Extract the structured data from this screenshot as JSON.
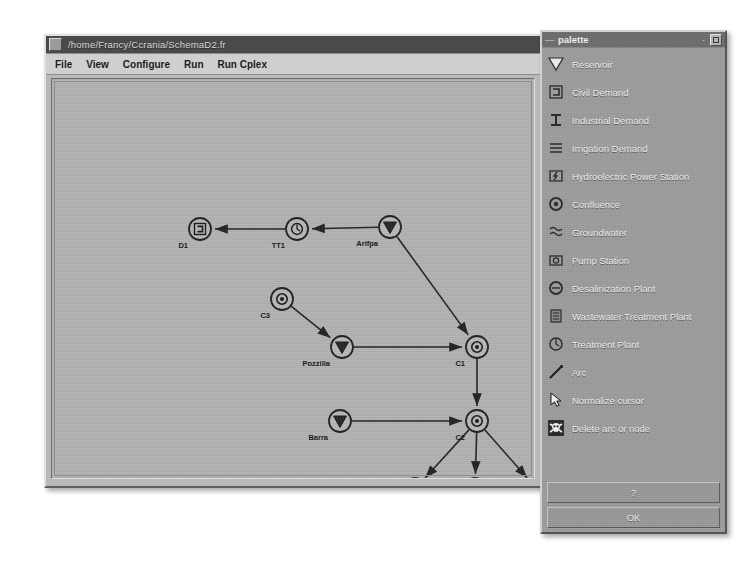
{
  "window": {
    "title": "/home/Francy/Ccrania/SchemaD2.fr",
    "menu": [
      "File",
      "View",
      "Configure",
      "Run",
      "Run Cplex"
    ]
  },
  "palette": {
    "title": "palette",
    "menu_glyph": "—",
    "minimize_glyph": "·",
    "items": [
      {
        "label": "Reservoir",
        "icon": "reservoir-triangle-icon"
      },
      {
        "label": "Civil Demand",
        "icon": "civil-demand-icon"
      },
      {
        "label": "Industrial Demand",
        "icon": "industrial-demand-icon"
      },
      {
        "label": "Irrigation Demand",
        "icon": "irrigation-demand-icon"
      },
      {
        "label": "Hydroelectric Power Station",
        "icon": "hydroelectric-power-station-icon"
      },
      {
        "label": "Confluence",
        "icon": "confluence-icon"
      },
      {
        "label": "Groundwater",
        "icon": "groundwater-icon"
      },
      {
        "label": "Pump Station",
        "icon": "pump-station-icon"
      },
      {
        "label": "Desalinization Plant",
        "icon": "desalinization-plant-icon"
      },
      {
        "label": "Wastewater Treatment Plant",
        "icon": "wastewater-treatment-plant-icon"
      },
      {
        "label": "Treatment Plant",
        "icon": "treatment-plant-icon"
      },
      {
        "label": "Arc",
        "icon": "arc-line-icon"
      },
      {
        "label": "Normalize cursor",
        "icon": "cursor-arrow-icon"
      },
      {
        "label": "Delete arc or node",
        "icon": "skull-delete-icon"
      }
    ],
    "buttons": [
      {
        "label": "?",
        "name": "help-button"
      },
      {
        "label": "OK",
        "name": "ok-button"
      }
    ]
  },
  "diagram": {
    "nodes": [
      {
        "id": "D1",
        "label": "D1",
        "type": "civil-demand",
        "x": 148,
        "y": 150
      },
      {
        "id": "TT1",
        "label": "TT1",
        "type": "treatment-plant",
        "x": 245,
        "y": 150
      },
      {
        "id": "Arifpa",
        "label": "Arifpa",
        "type": "reservoir",
        "x": 338,
        "y": 148
      },
      {
        "id": "C3",
        "label": "C3",
        "type": "confluence",
        "x": 230,
        "y": 220
      },
      {
        "id": "Pozzilla",
        "label": "Pozzilla",
        "type": "reservoir",
        "x": 290,
        "y": 268
      },
      {
        "id": "C1",
        "label": "C1",
        "type": "confluence",
        "x": 425,
        "y": 268
      },
      {
        "id": "Barra",
        "label": "Barra",
        "type": "reservoir",
        "x": 288,
        "y": 342
      },
      {
        "id": "C2",
        "label": "C2",
        "type": "confluence",
        "x": 425,
        "y": 342
      },
      {
        "id": "D2",
        "label": "D2",
        "type": "industrial-demand",
        "x": 363,
        "y": 410
      },
      {
        "id": "D3",
        "label": "D3",
        "type": "industrial-demand",
        "x": 423,
        "y": 410
      },
      {
        "id": "D4",
        "label": "D4",
        "type": "industrial-demand",
        "x": 485,
        "y": 410
      }
    ],
    "arcs": [
      {
        "from": "TT1",
        "to": "D1"
      },
      {
        "from": "Arifpa",
        "to": "TT1"
      },
      {
        "from": "Arifpa",
        "to": "C1"
      },
      {
        "from": "C3",
        "to": "Pozzilla"
      },
      {
        "from": "Pozzilla",
        "to": "C1"
      },
      {
        "from": "C1",
        "to": "C2"
      },
      {
        "from": "Barra",
        "to": "C2"
      },
      {
        "from": "C2",
        "to": "D2"
      },
      {
        "from": "C2",
        "to": "D3"
      },
      {
        "from": "C2",
        "to": "D4"
      }
    ]
  },
  "colors": {
    "window_face": "#b9b9b9",
    "title_bar": "#4a4a4a",
    "menu_bar": "#cfcfcf",
    "canvas": "#b4b4b4",
    "palette_face": "#9e9e9e",
    "palette_title": "#6f6f6f",
    "ink": "#1a1a1a"
  }
}
